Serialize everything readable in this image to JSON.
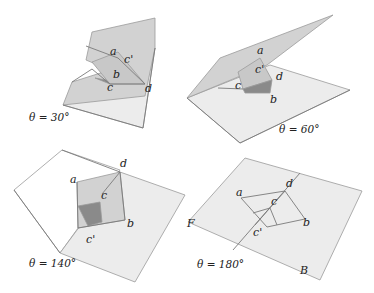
{
  "colors": {
    "sheet_light": "#ececec",
    "sheet_mid": "#d2d2d2",
    "sheet_dark": "#a9a9a9",
    "flap_light": "#c8c8c8",
    "flap_dark": "#8a8a8a",
    "stroke": "#9a9a9a",
    "line": "#7a7a7a"
  },
  "panels": [
    {
      "id": "theta30",
      "caption": "θ = 30°",
      "caption_pos": [
        29,
        121
      ],
      "polygons": [
        {
          "pts": "63,105 150,62 155,48 143,128",
          "fill": "sheet_light"
        },
        {
          "pts": "92,32 155,18 155,48 145,96 63,105 72,82 110,70 86,60",
          "fill": "sheet_mid"
        },
        {
          "pts": "92,62 118,52 145,84 110,84",
          "fill": "flap_light"
        },
        {
          "pts": "95,78 110,84 106,80",
          "fill": "flap_dark"
        }
      ],
      "lines": [
        "63,105 143,128",
        "143,128 155,48",
        "86,46 118,58 145,84 110,84 92,69 72,82"
      ],
      "labels": [
        {
          "t": "a",
          "x": 110,
          "y": 55
        },
        {
          "t": "c'",
          "x": 124,
          "y": 63
        },
        {
          "t": "b",
          "x": 113,
          "y": 78
        },
        {
          "t": "c",
          "x": 107,
          "y": 91
        },
        {
          "t": "d",
          "x": 145,
          "y": 92
        }
      ]
    },
    {
      "id": "theta60",
      "caption": "θ = 60°",
      "caption_pos": [
        279,
        133
      ],
      "polygons": [
        {
          "pts": "187,98 270,65 350,90 240,143",
          "fill": "sheet_light"
        },
        {
          "pts": "187,98 220,58 333,15 267,65",
          "fill": "sheet_mid"
        },
        {
          "pts": "238,72 260,58 272,80 243,89",
          "fill": "flap_light"
        },
        {
          "pts": "243,89 272,80 270,93 245,93",
          "fill": "flap_dark"
        }
      ],
      "lines": [
        "187,98 240,143",
        "240,143 350,90",
        "218,88 243,89"
      ],
      "labels": [
        {
          "t": "a",
          "x": 257,
          "y": 54
        },
        {
          "t": "c'",
          "x": 255,
          "y": 73
        },
        {
          "t": "d",
          "x": 276,
          "y": 80
        },
        {
          "t": "c",
          "x": 235,
          "y": 89
        },
        {
          "t": "b",
          "x": 270,
          "y": 103
        }
      ]
    },
    {
      "id": "theta140",
      "caption": "θ = 140°",
      "caption_pos": [
        29,
        267
      ],
      "polygons": [
        {
          "pts": "14,190 62,150 120,170 60,253",
          "fill": "#ffffff"
        },
        {
          "pts": "60,253 120,172 185,195 135,282",
          "fill": "sheet_light"
        },
        {
          "pts": "77,182 120,172 125,220 78,228",
          "fill": "sheet_mid"
        },
        {
          "pts": "78,206 100,202 102,222 88,226",
          "fill": "flap_dark"
        }
      ],
      "lines": [
        "62,150 120,172",
        "14,190 60,253",
        "120,172 125,220",
        "78,228 125,220",
        "77,182 78,228",
        "102,194 120,172"
      ],
      "labels": [
        {
          "t": "a",
          "x": 70,
          "y": 183
        },
        {
          "t": "d",
          "x": 120,
          "y": 167
        },
        {
          "t": "c",
          "x": 101,
          "y": 199
        },
        {
          "t": "b",
          "x": 127,
          "y": 227
        },
        {
          "t": "c'",
          "x": 86,
          "y": 243
        }
      ]
    },
    {
      "id": "theta180",
      "caption": "θ = 180°",
      "caption_pos": [
        197,
        268
      ],
      "polygons": [
        {
          "pts": "245,158 362,191 320,280 188,222",
          "fill": "sheet_light"
        }
      ],
      "lines": [
        "300,173 233,250",
        "241,198 285,191 305,219 267,227 241,198",
        "253,213 270,208",
        "270,208 277,225",
        "269,209 285,191",
        "255,225 269,209"
      ],
      "labels": [
        {
          "t": "a",
          "x": 236,
          "y": 196
        },
        {
          "t": "d",
          "x": 286,
          "y": 187
        },
        {
          "t": "c",
          "x": 271,
          "y": 205
        },
        {
          "t": "b",
          "x": 303,
          "y": 226
        },
        {
          "t": "c'",
          "x": 253,
          "y": 236
        },
        {
          "t": "F",
          "x": 187,
          "y": 227
        },
        {
          "t": "B",
          "x": 300,
          "y": 274
        }
      ]
    }
  ]
}
